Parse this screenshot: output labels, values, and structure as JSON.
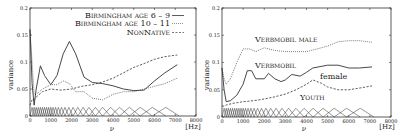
{
  "chart_data": [
    {
      "type": "line",
      "title": "",
      "xlabel": "ν",
      "xunit": "[Hz]",
      "ylabel": "variance",
      "xlim": [
        0,
        8000
      ],
      "ylim": [
        0,
        0.2
      ],
      "xticks": [
        "0",
        "1000",
        "2000",
        "3000",
        "4000",
        "5000",
        "6000",
        "7000",
        "8000"
      ],
      "yticks": [
        "0",
        "0.05",
        "0.1",
        "0.15",
        "0.2"
      ],
      "legend_position": "top-right",
      "series": [
        {
          "name": "Birmingham age 6 – 9",
          "style": "solid",
          "x": [
            0,
            100,
            200,
            300,
            500,
            700,
            1000,
            1300,
            1600,
            1900,
            2200,
            2600,
            3000,
            3500,
            4000,
            4500,
            5000,
            5500,
            6000,
            6500,
            7100
          ],
          "y": [
            0.16,
            0.06,
            0.02,
            0.05,
            0.093,
            0.075,
            0.058,
            0.075,
            0.115,
            0.138,
            0.115,
            0.072,
            0.062,
            0.06,
            0.056,
            0.05,
            0.047,
            0.048,
            0.065,
            0.08,
            0.095
          ]
        },
        {
          "name": "Birmingham age 10 – 11",
          "style": "dotted",
          "x": [
            0,
            100,
            200,
            300,
            600,
            1000,
            1300,
            1600,
            1900,
            2200,
            2600,
            3000,
            3500,
            4000,
            4500,
            5000,
            5500,
            6000,
            6500,
            7100
          ],
          "y": [
            0.16,
            0.1,
            0.04,
            0.04,
            0.05,
            0.058,
            0.058,
            0.065,
            0.06,
            0.045,
            0.045,
            0.033,
            0.03,
            0.04,
            0.045,
            0.045,
            0.05,
            0.055,
            0.06,
            0.07
          ]
        },
        {
          "name": "NonNative",
          "style": "dashed",
          "x": [
            0,
            100,
            200,
            300,
            600,
            1000,
            1500,
            2000,
            2500,
            3000,
            3500,
            4000,
            4500,
            5000,
            5500,
            6000,
            6500,
            7100
          ],
          "y": [
            0.02,
            0.03,
            0.03,
            0.035,
            0.045,
            0.05,
            0.048,
            0.05,
            0.055,
            0.058,
            0.063,
            0.07,
            0.08,
            0.09,
            0.097,
            0.105,
            0.11,
            0.113
          ]
        }
      ]
    },
    {
      "type": "line",
      "title": "",
      "xlabel": "ν",
      "xunit": "[Hz]",
      "ylabel": "variance",
      "xlim": [
        0,
        8000
      ],
      "ylim": [
        0,
        0.2
      ],
      "xticks": [
        "0",
        "1000",
        "2000",
        "3000",
        "4000",
        "5000",
        "6000",
        "7000",
        "8000"
      ],
      "yticks": [
        "0",
        "0.05",
        "0.1",
        "0.15",
        "0.2"
      ],
      "annotations": [
        "Verbmobil male",
        "Verbmobil female",
        "Youth"
      ],
      "series": [
        {
          "name": "Verbmobil male",
          "style": "dotted",
          "x": [
            0,
            100,
            200,
            400,
            700,
            1000,
            1300,
            1600,
            2000,
            2500,
            3000,
            3500,
            4000,
            4500,
            5000,
            5500,
            6000,
            6500,
            7100
          ],
          "y": [
            0.09,
            0.07,
            0.06,
            0.07,
            0.1,
            0.125,
            0.125,
            0.12,
            0.127,
            0.122,
            0.12,
            0.12,
            0.12,
            0.125,
            0.13,
            0.138,
            0.14,
            0.14,
            0.137
          ]
        },
        {
          "name": "Verbmobil female",
          "style": "solid",
          "x": [
            0,
            100,
            200,
            400,
            700,
            1000,
            1200,
            1400,
            1600,
            2000,
            2200,
            2500,
            2800,
            3000,
            3300,
            3700,
            4000,
            4300,
            5000,
            5500,
            6000,
            6500,
            7100
          ],
          "y": [
            0.09,
            0.05,
            0.028,
            0.03,
            0.04,
            0.06,
            0.085,
            0.085,
            0.07,
            0.07,
            0.08,
            0.07,
            0.065,
            0.068,
            0.078,
            0.075,
            0.082,
            0.09,
            0.095,
            0.095,
            0.09,
            0.09,
            0.092
          ]
        },
        {
          "name": "Youth",
          "style": "dashed",
          "x": [
            0,
            100,
            200,
            500,
            1000,
            1500,
            2000,
            2500,
            3000,
            3500,
            4000,
            4300,
            4700,
            5000,
            5500,
            6000,
            6500,
            7100
          ],
          "y": [
            0.02,
            0.02,
            0.022,
            0.025,
            0.028,
            0.03,
            0.033,
            0.037,
            0.042,
            0.05,
            0.06,
            0.068,
            0.062,
            0.055,
            0.05,
            0.05,
            0.053,
            0.057
          ]
        }
      ]
    }
  ],
  "left": {
    "legend": [
      "Birmingham age 6 – 9",
      "Birmingham age 10 – 11",
      "NonNative"
    ],
    "ylabel": "variance",
    "xlabel": "ν",
    "xunit": "[Hz]"
  },
  "right": {
    "label_male": "Verbmobil male",
    "label_vm": "Verbmobil",
    "label_female": "female",
    "label_youth": "Youth",
    "ylabel": "variance",
    "xlabel": "ν",
    "xunit": "[Hz]"
  }
}
